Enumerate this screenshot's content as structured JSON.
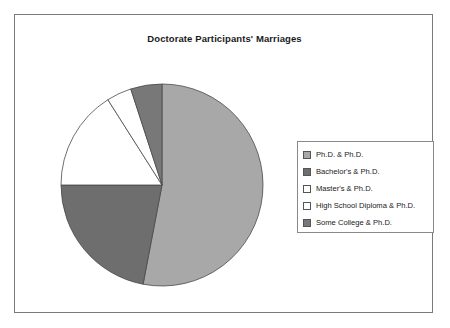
{
  "chart_data": {
    "type": "pie",
    "title": "Doctorate Participants' Marriages",
    "categories": [
      "Ph.D. & Ph.D.",
      "Bachelor's & Ph.D.",
      "Master's & Ph.D.",
      "High School Diploma & Ph.D.",
      "Some College & Ph.D."
    ],
    "values": [
      53,
      22,
      16,
      4,
      5
    ],
    "colors": [
      "#a8a8a8",
      "#6e6e6e",
      "#ffffff",
      "#ffffff",
      "#787878"
    ],
    "slice_border": "#4a4a4a",
    "legend_position": "right",
    "grid": false,
    "xlabel": "",
    "ylabel": ""
  },
  "frame": {
    "border_color": "#7b7b7b",
    "background": "#ffffff"
  },
  "legend": {
    "entries": [
      {
        "label": "Ph.D. & Ph.D.",
        "swatch": "#a8a8a8",
        "swatch_name": "legend-swatch-phd-phd"
      },
      {
        "label": "Bachelor's & Ph.D.",
        "swatch": "#6e6e6e",
        "swatch_name": "legend-swatch-bachelors-phd"
      },
      {
        "label": "Master's & Ph.D.",
        "swatch": "#ffffff",
        "swatch_name": "legend-swatch-masters-phd"
      },
      {
        "label": "High School Diploma & Ph.D.",
        "swatch": "#ffffff",
        "swatch_name": "legend-swatch-highschool-phd"
      },
      {
        "label": "Some College & Ph.D.",
        "swatch": "#787878",
        "swatch_name": "legend-swatch-somecollege-phd"
      }
    ]
  }
}
